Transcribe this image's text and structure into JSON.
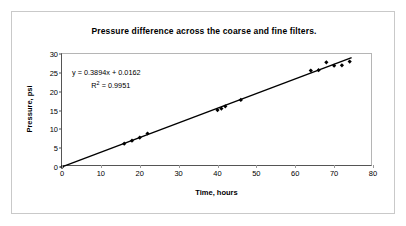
{
  "chart_data": {
    "type": "scatter",
    "title": "Pressure difference across the coarse and fine filters.",
    "xlabel": "Time, hours",
    "ylabel": "Pressure, psi",
    "xlim": [
      0,
      80
    ],
    "ylim": [
      0,
      30
    ],
    "xticks": [
      0,
      10,
      20,
      30,
      40,
      50,
      60,
      70,
      80
    ],
    "yticks": [
      0,
      5,
      10,
      15,
      20,
      25,
      30
    ],
    "grid": false,
    "legend": null,
    "series": [
      {
        "name": "Pressure difference",
        "marker": "diamond",
        "color": "#000000",
        "x": [
          0,
          16,
          18,
          20,
          22,
          40,
          41,
          42,
          46,
          64,
          66,
          68,
          70,
          72,
          74
        ],
        "y": [
          0,
          6.2,
          7.0,
          7.8,
          8.9,
          15.1,
          15.5,
          16.1,
          17.8,
          25.6,
          25.7,
          27.8,
          26.9,
          27.0,
          28.0
        ]
      }
    ],
    "trendline": {
      "type": "linear",
      "slope": 0.3894,
      "intercept": 0.0162,
      "r_squared": 0.9951,
      "equation_label": "y = 0.3894x + 0.0162",
      "r2_label_prefix": "R",
      "r2_label_sup": "2",
      "r2_label_value": " = 0.9951",
      "color": "#000000",
      "x_start": 0,
      "x_end": 74.5
    }
  },
  "axis": {
    "x_tick_labels": [
      "0",
      "10",
      "20",
      "30",
      "40",
      "50",
      "60",
      "70",
      "80"
    ],
    "y_tick_labels": [
      "0",
      "5",
      "10",
      "15",
      "20",
      "25",
      "30"
    ]
  }
}
